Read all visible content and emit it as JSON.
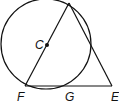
{
  "diagram": {
    "type": "geometry",
    "labels": {
      "center": "C",
      "left_bottom": "F",
      "middle_bottom": "G",
      "right_bottom": "E"
    },
    "colors": {
      "stroke": "#111111",
      "background": "#ffffff"
    }
  }
}
